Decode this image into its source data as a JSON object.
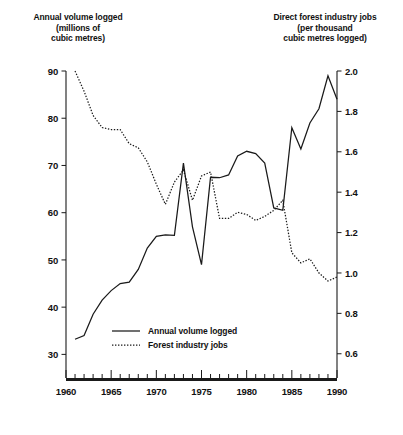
{
  "chart_data": {
    "type": "line",
    "title": "",
    "xlabel": "",
    "left_axis": {
      "label": "Annual volume logged\n(millions of\ncubic metres)",
      "ticks": [
        30,
        40,
        50,
        60,
        70,
        80,
        90
      ],
      "ylim": [
        25,
        90
      ],
      "tick_labels": [
        "30",
        "40",
        "50",
        "60",
        "70",
        "80",
        "90"
      ]
    },
    "right_axis": {
      "label": "Direct forest industry jobs\n(per thousand\ncubic metres logged)",
      "ticks": [
        0.6,
        0.8,
        1.0,
        1.2,
        1.4,
        1.6,
        1.8,
        2.0
      ],
      "ylim": [
        0.48,
        2.0
      ],
      "tick_labels": [
        "0.6",
        "0.8",
        "1.0",
        "1.2",
        "1.4",
        "1.6",
        "1.8",
        "2.0"
      ]
    },
    "x": [
      1960,
      1961,
      1962,
      1963,
      1964,
      1965,
      1966,
      1967,
      1968,
      1969,
      1970,
      1971,
      1972,
      1973,
      1974,
      1975,
      1976,
      1977,
      1978,
      1979,
      1980,
      1981,
      1982,
      1983,
      1984,
      1985,
      1986,
      1987,
      1988,
      1989,
      1990
    ],
    "xlim": [
      1960,
      1990
    ],
    "x_tick_labels": [
      "1960",
      "1965",
      "1970",
      "1975",
      "1980",
      "1985",
      "1990"
    ],
    "x_major_ticks": [
      1960,
      1965,
      1970,
      1975,
      1980,
      1985,
      1990
    ],
    "x_minor_tick_interval": 1,
    "grid": false,
    "legend_position": "bottom-center",
    "series": [
      {
        "name": "Annual volume logged",
        "axis": "left",
        "style": "solid",
        "color": "#1a1a1a",
        "x": [
          1961,
          1962,
          1963,
          1964,
          1965,
          1966,
          1967,
          1968,
          1969,
          1970,
          1971,
          1972,
          1973,
          1974,
          1975,
          1976,
          1977,
          1978,
          1979,
          1980,
          1981,
          1982,
          1983,
          1984,
          1985,
          1986,
          1987,
          1988,
          1989,
          1990
        ],
        "values": [
          33.2,
          34.0,
          38.5,
          41.5,
          43.5,
          45.0,
          45.3,
          48.0,
          52.5,
          55.0,
          55.3,
          55.2,
          70.5,
          57.0,
          49.0,
          67.5,
          67.4,
          68.0,
          72.0,
          73.0,
          72.5,
          70.5,
          61.0,
          60.5,
          78.0,
          73.5,
          79.0,
          82.0,
          89.0,
          84.0
        ]
      },
      {
        "name": "Forest industry jobs",
        "axis": "right",
        "style": "dotted",
        "color": "#1a1a1a",
        "x": [
          1961,
          1962,
          1963,
          1964,
          1965,
          1966,
          1967,
          1968,
          1969,
          1970,
          1971,
          1972,
          1973,
          1974,
          1975,
          1976,
          1977,
          1978,
          1979,
          1980,
          1981,
          1982,
          1983,
          1984,
          1985,
          1986,
          1987,
          1988,
          1989,
          1990
        ],
        "values": [
          2.0,
          1.9,
          1.78,
          1.72,
          1.71,
          1.71,
          1.64,
          1.62,
          1.55,
          1.44,
          1.34,
          1.45,
          1.51,
          1.36,
          1.48,
          1.5,
          1.27,
          1.27,
          1.3,
          1.29,
          1.26,
          1.28,
          1.31,
          1.36,
          1.1,
          1.05,
          1.07,
          1.0,
          0.96,
          0.98
        ]
      }
    ],
    "legend": [
      {
        "label": "Annual volume logged",
        "style": "solid"
      },
      {
        "label": "Forest industry jobs",
        "style": "dotted"
      }
    ]
  }
}
